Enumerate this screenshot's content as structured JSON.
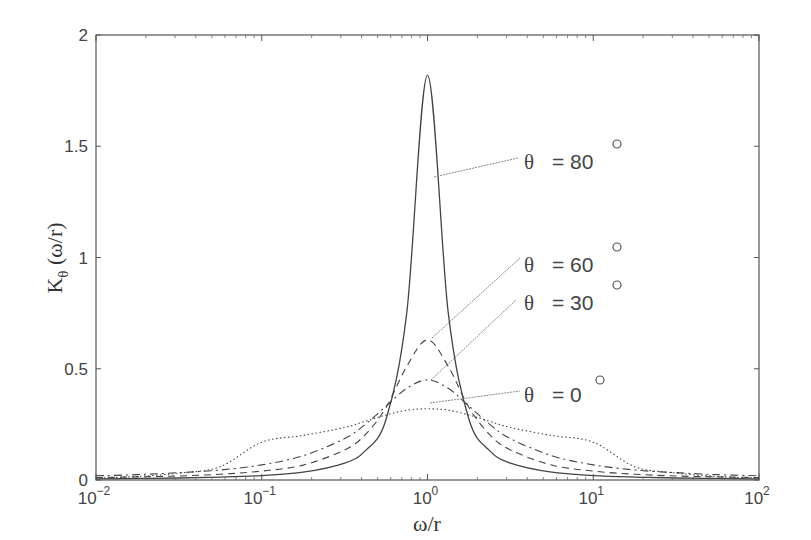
{
  "chart_data": {
    "type": "line",
    "title": "",
    "xlabel": "ω/r",
    "ylabel": "Kθ (ω/r)",
    "ylabel_main": "K",
    "ylabel_sub": "θ",
    "ylabel_rest": " (ω/r)",
    "xscale": "log",
    "xlim": [
      0.01,
      100
    ],
    "ylim": [
      0,
      2
    ],
    "grid": false,
    "x_ticks": [
      {
        "base": "10",
        "exp": "−2",
        "value": 0.01
      },
      {
        "base": "10",
        "exp": "−1",
        "value": 0.1
      },
      {
        "base": "10",
        "exp": "0",
        "value": 1
      },
      {
        "base": "10",
        "exp": "1",
        "value": 10
      },
      {
        "base": "10",
        "exp": "2",
        "value": 100
      }
    ],
    "y_ticks": [
      {
        "label": "0",
        "value": 0
      },
      {
        "label": "0.5",
        "value": 0.5
      },
      {
        "label": "1",
        "value": 1
      },
      {
        "label": "1.5",
        "value": 1.5
      },
      {
        "label": "2",
        "value": 2
      }
    ],
    "log10_x": [
      -2,
      -1.75,
      -1.5,
      -1.25,
      -1,
      -0.75,
      -0.5,
      -0.375,
      -0.25,
      -0.125,
      0,
      0.125,
      0.25,
      0.375,
      0.5,
      0.75,
      1,
      1.25,
      1.5,
      1.75,
      2
    ],
    "series": [
      {
        "name": "θ = 80°",
        "label_theta": "θ",
        "label_value": "= 80",
        "degree": "o",
        "style": "solid",
        "peak": 1.82,
        "values": [
          0.005,
          0.007,
          0.009,
          0.013,
          0.02,
          0.035,
          0.076,
          0.132,
          0.273,
          0.752,
          1.82,
          0.752,
          0.273,
          0.132,
          0.076,
          0.035,
          0.02,
          0.013,
          0.009,
          0.007,
          0.005
        ]
      },
      {
        "name": "θ = 60°",
        "label_theta": "θ",
        "label_value": "= 60",
        "degree": "o",
        "style": "dashed",
        "peak": 0.63,
        "values": [
          0.011,
          0.014,
          0.018,
          0.026,
          0.04,
          0.067,
          0.135,
          0.204,
          0.326,
          0.511,
          0.63,
          0.511,
          0.326,
          0.204,
          0.135,
          0.067,
          0.04,
          0.026,
          0.018,
          0.014,
          0.011
        ]
      },
      {
        "name": "θ = 30°",
        "label_theta": "θ",
        "label_value": "= 30",
        "degree": "o",
        "style": "dashdot",
        "peak": 0.45,
        "values": [
          0.019,
          0.024,
          0.033,
          0.045,
          0.068,
          0.109,
          0.186,
          0.25,
          0.332,
          0.412,
          0.45,
          0.412,
          0.332,
          0.25,
          0.186,
          0.109,
          0.068,
          0.045,
          0.033,
          0.024,
          0.019
        ]
      },
      {
        "name": "θ = 0°",
        "label_theta": "θ",
        "label_value": "= 0",
        "degree": "o",
        "style": "dotted",
        "peak": 0.32,
        "values": [
          0.008,
          0.016,
          0.031,
          0.06,
          0.17,
          0.2,
          0.236,
          0.264,
          0.292,
          0.314,
          0.32,
          0.314,
          0.292,
          0.264,
          0.236,
          0.2,
          0.17,
          0.06,
          0.031,
          0.016,
          0.008
        ]
      }
    ],
    "annotations": [
      {
        "text": "θ = 80°",
        "series": "θ = 80°",
        "point_at": [
          1.05,
          1.36
        ]
      },
      {
        "text": "θ = 60°",
        "series": "θ = 60°",
        "point_at": [
          1.0,
          0.63
        ]
      },
      {
        "text": "θ = 30°",
        "series": "θ = 30°",
        "point_at": [
          1.0,
          0.45
        ]
      },
      {
        "text": "θ = 0°",
        "series": "θ = 0°",
        "point_at": [
          1.0,
          0.32
        ]
      }
    ]
  }
}
